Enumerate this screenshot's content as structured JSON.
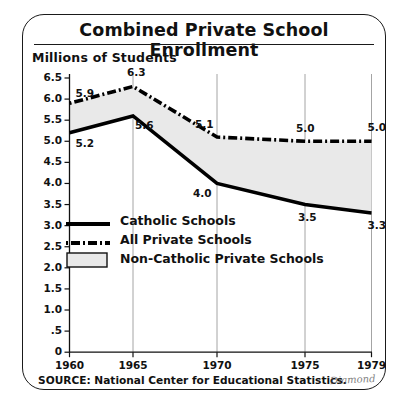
{
  "chart_data": {
    "type": "line",
    "title": "Combined Private School Enrollment",
    "ylabel": "Millions of Students",
    "xlabel": "",
    "categories": [
      "1960",
      "1965",
      "1970",
      "1975",
      "1979"
    ],
    "x": [
      1960,
      1965,
      1970,
      1975,
      1979
    ],
    "xlim": [
      1960,
      1979
    ],
    "ylim": [
      0,
      6.5
    ],
    "grid": true,
    "legend_position": "inside-left",
    "series": [
      {
        "name": "Catholic Schools",
        "style": "solid",
        "color": "#000000",
        "values": [
          5.2,
          5.6,
          4.0,
          3.5,
          3.3
        ],
        "labels": [
          "5.2",
          "5.6",
          "4.0",
          "3.5",
          "3.3"
        ]
      },
      {
        "name": "All Private Schools",
        "style": "dash-dot",
        "color": "#000000",
        "values": [
          5.9,
          6.3,
          5.1,
          5.0,
          5.0
        ],
        "labels": [
          "5.9",
          "6.3",
          "5.1",
          "5.0",
          "5.0"
        ]
      },
      {
        "name": "Non-Catholic Private Schools",
        "style": "filled-area",
        "color": "#e9e9e9",
        "values": [
          0.7,
          0.7,
          1.1,
          1.5,
          1.7
        ],
        "labels": []
      }
    ],
    "ytick_labels": [
      "6.5",
      "6.0",
      "5.5",
      "5.0",
      "4.5",
      "4.0",
      "3.5",
      "3.0",
      "2.5",
      "2.0",
      "1.5",
      "1.0",
      ".5",
      "0"
    ],
    "ytick_values": [
      6.5,
      6.0,
      5.5,
      5.0,
      4.5,
      4.0,
      3.5,
      3.0,
      2.5,
      2.0,
      1.5,
      1.0,
      0.5,
      0
    ]
  },
  "legend": {
    "items": [
      {
        "label": "Catholic Schools",
        "swatch": "solid-line-swatch"
      },
      {
        "label": "All Private Schools",
        "swatch": "dash-dot-line-swatch"
      },
      {
        "label": "Non-Catholic Private Schools",
        "swatch": "gray-box-swatch"
      }
    ]
  },
  "footer": {
    "source": "SOURCE: National Center for Educational Statistics.",
    "signature": "Diamond"
  }
}
